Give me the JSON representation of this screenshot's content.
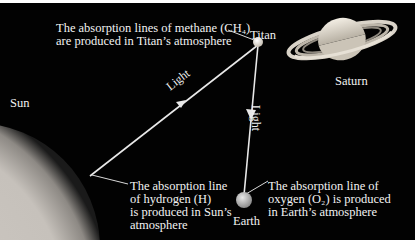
{
  "labels": {
    "sun": "Sun",
    "titan": "Titan",
    "saturn": "Saturn",
    "earth": "Earth",
    "light_1": "Light",
    "light_2": "Light"
  },
  "annotations": {
    "methane": [
      "The absorption lines of methane (CH₄)",
      "are produced in Titan’s atmosphere"
    ],
    "hydrogen": [
      "The absorption line",
      "of hydrogen (H)",
      "is produced in Sun’s",
      "atmosphere"
    ],
    "oxygen": [
      "The absorption line of",
      "oxygen (O₂) is produced",
      "in Earth’s atmosphere"
    ]
  },
  "colors": {
    "background": "#020202",
    "text": "#f2f2f2",
    "light_ray": "#e8e8e8",
    "sun": "#d9d6d2"
  }
}
